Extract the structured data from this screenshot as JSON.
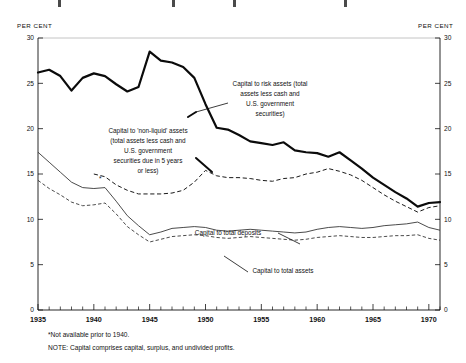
{
  "axes": {
    "left_title": "PER CENT",
    "right_title": "PER CENT",
    "y_ticks": [
      "0",
      "5",
      "10",
      "15",
      "20",
      "25",
      "30"
    ],
    "y_ticks_right": [
      "0",
      "5",
      "10",
      "15",
      "20",
      "25",
      "30"
    ],
    "x_ticks": [
      "1935",
      "1940",
      "1945",
      "1950",
      "1955",
      "1960",
      "1965",
      "1970"
    ],
    "y_min": 0,
    "y_max": 30,
    "x_min": 1935,
    "x_max": 1971
  },
  "annotations": {
    "risk_assets": "Capital to risk assets (total assets less cash and U.S. government securities)",
    "non_liquid": "Capital to 'non-liquid' assets (total assets less cash and U.S. government securities due in 5 years or less)",
    "total_deposits": "Capital to total deposits",
    "total_assets": "Capital to total assets"
  },
  "footnotes": {
    "asterisk": "*Not available prior to 1940.",
    "note": "NOTE: Capital comprises capital, surplus, and undivided profits."
  },
  "colors": {
    "ink": "#0b0b0b",
    "background": "#ffffff",
    "grid": "#bdbdbd"
  },
  "chart_data": {
    "type": "line",
    "title": "",
    "xlabel": "",
    "ylabel": "PER CENT",
    "ylim": [
      0,
      30
    ],
    "xlim": [
      1935,
      1971
    ],
    "grid": false,
    "legend": "annotated-inline",
    "x": [
      1935,
      1936,
      1937,
      1938,
      1939,
      1940,
      1941,
      1942,
      1943,
      1944,
      1945,
      1946,
      1947,
      1948,
      1949,
      1950,
      1951,
      1952,
      1953,
      1954,
      1955,
      1956,
      1957,
      1958,
      1959,
      1960,
      1961,
      1962,
      1963,
      1964,
      1965,
      1966,
      1967,
      1968,
      1969,
      1970,
      1971
    ],
    "series": [
      {
        "name": "Capital to risk assets (total assets less cash and U.S. government securities)",
        "style": "thick-solid",
        "values": [
          26.2,
          26.5,
          25.8,
          24.2,
          25.6,
          26.1,
          25.8,
          24.9,
          24.1,
          24.6,
          28.5,
          27.5,
          27.3,
          26.8,
          25.6,
          22.7,
          20.1,
          19.9,
          19.3,
          18.6,
          18.4,
          18.2,
          18.5,
          17.6,
          17.4,
          17.3,
          16.9,
          17.4,
          16.5,
          15.6,
          14.6,
          13.8,
          13.0,
          12.3,
          11.4,
          11.8,
          11.9
        ]
      },
      {
        "name": "Capital to 'non-liquid' assets (total assets less cash and U.S. government securities due in 5 years or less)",
        "style": "bold-dashed",
        "values": [
          null,
          null,
          null,
          null,
          null,
          15.0,
          14.7,
          13.8,
          13.2,
          12.8,
          12.8,
          12.8,
          12.9,
          13.2,
          14.1,
          15.4,
          14.8,
          14.6,
          14.6,
          14.5,
          14.3,
          14.2,
          14.5,
          14.6,
          15.0,
          15.2,
          15.6,
          15.3,
          14.9,
          14.3,
          13.5,
          12.7,
          12.0,
          11.4,
          10.8,
          11.3,
          11.5
        ]
      },
      {
        "name": "Capital to total deposits",
        "style": "thin-solid",
        "values": [
          17.4,
          16.3,
          15.2,
          14.1,
          13.5,
          13.4,
          13.5,
          12.0,
          10.4,
          9.3,
          8.3,
          8.6,
          9.0,
          9.1,
          9.2,
          9.1,
          8.8,
          8.7,
          8.8,
          8.9,
          8.8,
          8.7,
          8.6,
          8.5,
          8.6,
          8.9,
          9.1,
          9.2,
          9.1,
          9.0,
          9.1,
          9.3,
          9.4,
          9.5,
          9.7,
          9.1,
          8.8
        ]
      },
      {
        "name": "Capital to total assets",
        "style": "thin-dashed",
        "values": [
          14.3,
          13.4,
          12.7,
          11.9,
          11.5,
          11.6,
          11.8,
          10.6,
          9.2,
          8.3,
          7.5,
          7.8,
          8.1,
          8.2,
          8.3,
          8.2,
          8.0,
          7.9,
          8.0,
          8.1,
          8.0,
          7.9,
          7.8,
          7.7,
          7.8,
          8.0,
          8.1,
          8.2,
          8.1,
          8.0,
          8.0,
          8.1,
          8.2,
          8.2,
          8.3,
          7.9,
          7.7
        ]
      }
    ]
  }
}
